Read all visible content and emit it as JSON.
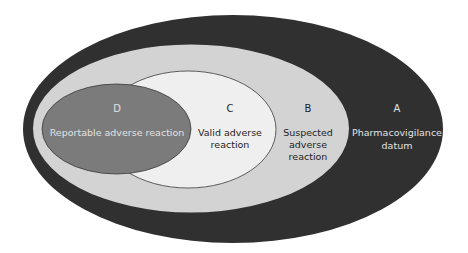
{
  "diagram": {
    "type": "nested-ellipses",
    "colors": {
      "A_fill": "#303030",
      "B_fill": "#d3d3d3",
      "C_fill": "#efefef",
      "D_fill": "#7b7b7b",
      "outline": "#3a3a3a",
      "text_on_dark": "#e2e2e2",
      "text_on_light": "#1e1e1e"
    },
    "sets": [
      {
        "id": "A",
        "letter": "A",
        "label_lines": [
          "Pharmacovigilance",
          "datum"
        ]
      },
      {
        "id": "B",
        "letter": "B",
        "label_lines": [
          "Suspected",
          "adverse",
          "reaction"
        ]
      },
      {
        "id": "C",
        "letter": "C",
        "label_lines": [
          "Valid adverse",
          "reaction"
        ]
      },
      {
        "id": "D",
        "letter": "D",
        "label_lines": [
          "Reportable adverse reaction"
        ]
      }
    ]
  }
}
